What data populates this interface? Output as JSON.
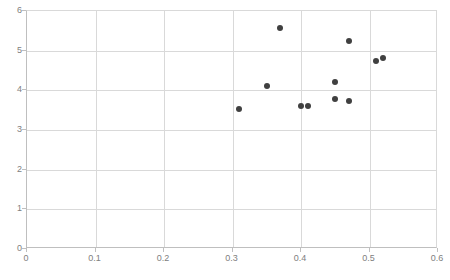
{
  "chart_data": {
    "type": "scatter",
    "title": "",
    "xlabel": "",
    "ylabel": "",
    "xlim": [
      0,
      0.6
    ],
    "ylim": [
      0,
      6
    ],
    "xticks": [
      0,
      0.1,
      0.2,
      0.3,
      0.4,
      0.5,
      0.6
    ],
    "xtick_labels": [
      "0",
      "0.1",
      "0.2",
      "0.3",
      "0.4",
      "0.5",
      "0.6"
    ],
    "yticks": [
      0,
      1,
      2,
      3,
      4,
      5,
      6
    ],
    "ytick_labels": [
      "0",
      "1",
      "2",
      "3",
      "4",
      "5",
      "6"
    ],
    "grid": true,
    "legend": false,
    "legend_position": "none",
    "marker_color": "#404040",
    "marker_size_px": 6,
    "gridline_color": "#d9d9d9",
    "axis_color": "#bfbfbf",
    "tick_label_color": "#808080",
    "background_color": "#ffffff",
    "series": [
      {
        "name": "series-1",
        "points": [
          {
            "x": 0.31,
            "y": 3.52
          },
          {
            "x": 0.35,
            "y": 4.1
          },
          {
            "x": 0.37,
            "y": 5.58
          },
          {
            "x": 0.4,
            "y": 3.61
          },
          {
            "x": 0.41,
            "y": 3.61
          },
          {
            "x": 0.45,
            "y": 4.22
          },
          {
            "x": 0.45,
            "y": 3.78
          },
          {
            "x": 0.47,
            "y": 5.25
          },
          {
            "x": 0.47,
            "y": 3.72
          },
          {
            "x": 0.51,
            "y": 4.75
          },
          {
            "x": 0.52,
            "y": 4.82
          }
        ]
      }
    ]
  }
}
